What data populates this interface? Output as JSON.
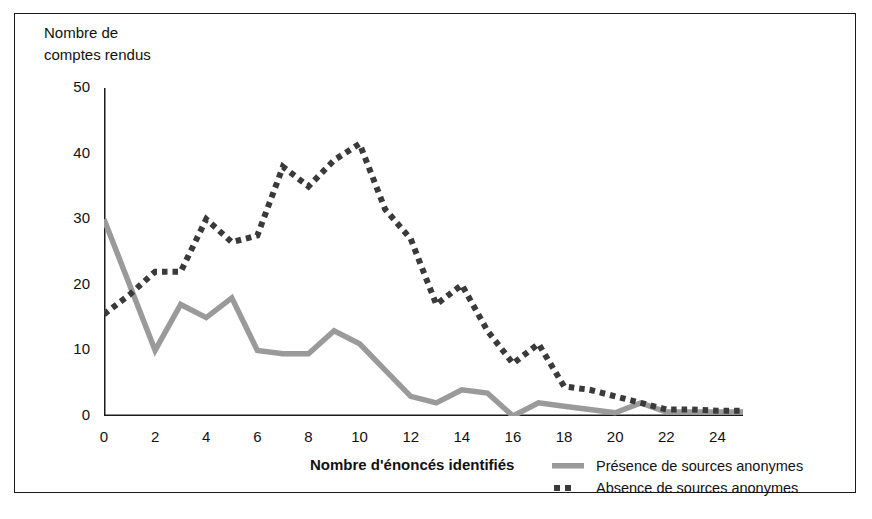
{
  "figure": {
    "y_axis_caption_line1": "Nombre de",
    "y_axis_caption_line2": "comptes rendus",
    "x_axis_title": "Nombre d'énoncés identifiés"
  },
  "legend": {
    "position": "bottom-right",
    "items": [
      {
        "label": "Présence de sources anonymes",
        "style": "solid",
        "color": "#9a9a9a",
        "marker": "legend-swatch-solid"
      },
      {
        "label": "Absence de sources anonymes",
        "style": "dotted",
        "color": "#3a3a3a",
        "marker": "legend-swatch-dotted"
      }
    ]
  },
  "chart_data": {
    "type": "line",
    "title": "",
    "subtitle": "",
    "xlabel": "Nombre d'énoncés identifiés",
    "ylabel": "Nombre de comptes rendus",
    "xlim": [
      0,
      25
    ],
    "ylim": [
      0,
      50
    ],
    "xticks": [
      0,
      2,
      4,
      6,
      8,
      10,
      12,
      14,
      16,
      18,
      20,
      22,
      24
    ],
    "xtick_labels": [
      "0",
      "2",
      "4",
      "6",
      "8",
      "10",
      "12",
      "14",
      "16",
      "18",
      "20",
      "22",
      "24"
    ],
    "xminor_ticks": [
      1,
      3,
      5,
      7,
      9,
      11,
      13,
      15,
      17,
      19,
      21,
      23,
      25
    ],
    "yticks": [
      0,
      10,
      20,
      30,
      40,
      50
    ],
    "ytick_labels": [
      "0",
      "10",
      "20",
      "30",
      "40",
      "50"
    ],
    "grid": false,
    "x": [
      0,
      1,
      2,
      3,
      4,
      5,
      6,
      7,
      8,
      9,
      10,
      11,
      12,
      13,
      14,
      15,
      16,
      17,
      18,
      19,
      20,
      21,
      22,
      23,
      24,
      25
    ],
    "series": [
      {
        "name": "Présence de sources anonymes",
        "style": "solid",
        "color": "#9a9a9a",
        "values": [
          30,
          20,
          10,
          17,
          15,
          18,
          10,
          9.5,
          9.5,
          13,
          11,
          7,
          3,
          2,
          4,
          3.5,
          0,
          2,
          1.5,
          1,
          0.5,
          2,
          0.6,
          0.6,
          0.6,
          0.6
        ]
      },
      {
        "name": "Absence de sources anonymes",
        "style": "dotted",
        "color": "#3a3a3a",
        "values": [
          15.5,
          18.5,
          22,
          22,
          30,
          26.5,
          27.5,
          38,
          35,
          39,
          41.5,
          31.5,
          27,
          17,
          20,
          13,
          8,
          11,
          4.5,
          4,
          3,
          2,
          1,
          1,
          0.8,
          0.8
        ]
      }
    ]
  }
}
